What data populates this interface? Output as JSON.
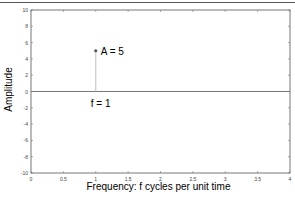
{
  "chart_data": {
    "type": "stem",
    "title": "",
    "xlabel": "Frequency: f cycles per unit time",
    "ylabel": "Amplitude",
    "xlim": [
      0,
      4
    ],
    "ylim": [
      -10,
      10
    ],
    "xticks": [
      0,
      0.5,
      1,
      1.5,
      2,
      2.5,
      3,
      3.5,
      4
    ],
    "xtick_labels": [
      "0",
      "0.5",
      "1",
      "1.5",
      "2",
      "2.5",
      "3",
      "3.5",
      "4"
    ],
    "yticks": [
      -10,
      -8,
      -6,
      -4,
      -2,
      0,
      2,
      4,
      6,
      8,
      10
    ],
    "ytick_labels": [
      "-10",
      "-8",
      "-6",
      "-4",
      "-2",
      "0",
      "2",
      "4",
      "6",
      "8",
      "10"
    ],
    "grid": false,
    "series": [
      {
        "name": "spectrum",
        "x": [
          1
        ],
        "values": [
          5
        ]
      }
    ],
    "baseline": 0,
    "annotations": [
      {
        "text": "A = 5",
        "x": 1,
        "y": 5
      },
      {
        "text": "f = 1",
        "x": 1,
        "y": -1.2
      }
    ]
  },
  "colors": {
    "stem": "#c8c8c8",
    "marker": "#555555",
    "axes": "#777777",
    "baseline": "#777777"
  }
}
